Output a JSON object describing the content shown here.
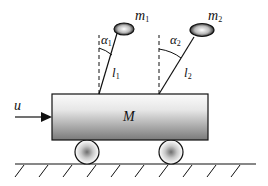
{
  "diagram": {
    "type": "double-inverted-pendulum-on-cart",
    "labels": {
      "mass1": {
        "base": "m",
        "sub": "1"
      },
      "mass2": {
        "base": "m",
        "sub": "2"
      },
      "angle1": {
        "base": "α",
        "sub": "1"
      },
      "angle2": {
        "base": "α",
        "sub": "2"
      },
      "length1": {
        "base": "l",
        "sub": "1"
      },
      "length2": {
        "base": "l",
        "sub": "2"
      },
      "cart_mass": "M",
      "input_force": "u"
    },
    "colors": {
      "line": "#111111",
      "cart_top": "#f2f2f2",
      "cart_bottom": "#7a7a7a",
      "wheel_center": "#777777"
    }
  }
}
